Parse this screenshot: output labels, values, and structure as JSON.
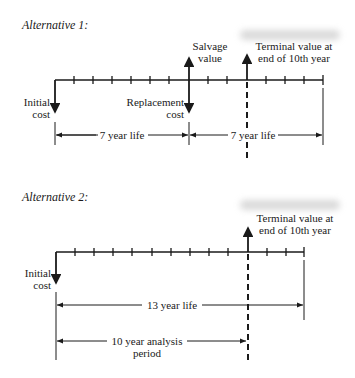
{
  "alternative1": {
    "title": "Alternative 1:",
    "labels": {
      "initial_cost_1": "Initial",
      "initial_cost_2": "cost",
      "replacement_cost_1": "Replacement",
      "replacement_cost_2": "cost",
      "salvage_value_1": "Salvage",
      "salvage_value_2": "value",
      "terminal_value_1": "Terminal value at",
      "terminal_value_2": "end of 10th year"
    },
    "spans": [
      "7 year life",
      "7 year life"
    ],
    "years_on_axis": 14
  },
  "alternative2": {
    "title": "Alternative 2:",
    "labels": {
      "initial_cost_1": "Initial",
      "initial_cost_2": "cost",
      "terminal_value_1": "Terminal value at",
      "terminal_value_2": "end of 10th year"
    },
    "spans": [
      "13 year life"
    ],
    "analysis_period_1": "10 year analysis",
    "analysis_period_2": "period",
    "years_on_axis": 13
  },
  "colors": {
    "ink": "#1a1a1a",
    "background": "#ffffff"
  }
}
